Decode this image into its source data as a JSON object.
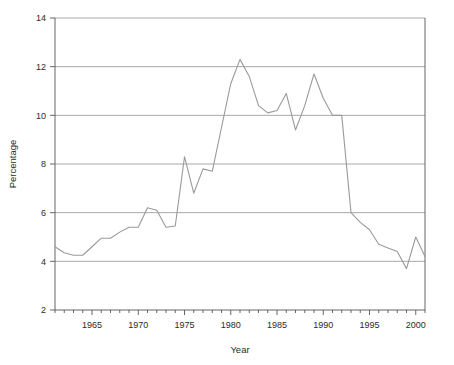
{
  "chart_data": {
    "type": "line",
    "title": "",
    "xlabel": "Year",
    "ylabel": "Percentage",
    "xlim": [
      1961,
      2001
    ],
    "ylim": [
      2,
      14
    ],
    "grid": true,
    "grid_axis": "y",
    "legend": "none",
    "line_color": "#9a9a9a",
    "grid_color": "#9e9e9e",
    "axis_color": "#555555",
    "background_color": "#ffffff",
    "x_major_ticks": [
      1965,
      1970,
      1975,
      1980,
      1985,
      1990,
      1995,
      2000
    ],
    "x_major_tick_labels": [
      "1965",
      "1970",
      "1975",
      "1980",
      "1985",
      "1990",
      "1995",
      "2000"
    ],
    "x_minor_tick_interval": 1,
    "y_ticks": [
      2,
      4,
      6,
      8,
      10,
      12,
      14
    ],
    "y_tick_labels": [
      "2",
      "4",
      "6",
      "8",
      "10",
      "12",
      "14"
    ],
    "x": [
      1961,
      1962,
      1963,
      1964,
      1965,
      1966,
      1967,
      1968,
      1969,
      1970,
      1971,
      1972,
      1973,
      1974,
      1975,
      1976,
      1977,
      1978,
      1979,
      1980,
      1981,
      1982,
      1983,
      1984,
      1985,
      1986,
      1987,
      1988,
      1989,
      1990,
      1991,
      1992,
      1993,
      1994,
      1995,
      1996,
      1997,
      1998,
      1999,
      2000,
      2001
    ],
    "values": [
      4.6,
      4.35,
      4.25,
      4.25,
      4.6,
      4.95,
      4.95,
      5.2,
      5.4,
      5.4,
      6.2,
      6.1,
      5.4,
      5.45,
      8.3,
      6.8,
      7.8,
      7.7,
      9.5,
      11.3,
      12.3,
      11.6,
      10.4,
      10.1,
      10.2,
      10.9,
      9.4,
      10.4,
      11.7,
      10.7,
      10.0,
      10.0,
      6.0,
      5.6,
      5.3,
      4.7,
      4.55,
      4.4,
      3.7,
      5.0,
      4.2
    ]
  },
  "plot_geometry": {
    "left": 55,
    "right": 425,
    "top": 18,
    "bottom": 310
  }
}
